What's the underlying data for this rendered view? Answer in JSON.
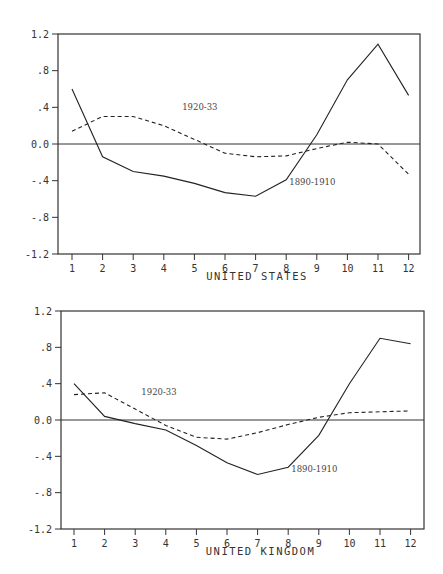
{
  "chart_data": [
    {
      "type": "line",
      "title": "",
      "xlabel": "UNITED STATES",
      "ylabel": "",
      "x": [
        1,
        2,
        3,
        4,
        5,
        6,
        7,
        8,
        9,
        10,
        11,
        12
      ],
      "xticks": [
        "1",
        "2",
        "3",
        "4",
        "5",
        "6",
        "7",
        "8",
        "9",
        "10",
        "11",
        "12"
      ],
      "yticks": [
        "1.2",
        ".8",
        ".4",
        "0.0",
        "-.4",
        "-.8",
        "-1.2"
      ],
      "ytick_values": [
        1.2,
        0.8,
        0.4,
        0.0,
        -0.4,
        -0.8,
        -1.2
      ],
      "ylim": [
        -1.2,
        1.2
      ],
      "grid": false,
      "zero_line": true,
      "series": [
        {
          "name": "1890-1910",
          "style": "solid",
          "values": [
            0.6,
            -0.14,
            -0.3,
            -0.35,
            -0.43,
            -0.53,
            -0.57,
            -0.39,
            0.1,
            0.7,
            1.09,
            0.53
          ]
        },
        {
          "name": "1920-33",
          "style": "dashed",
          "values": [
            0.14,
            0.3,
            0.3,
            0.2,
            0.05,
            -0.1,
            -0.14,
            -0.13,
            -0.05,
            0.02,
            0.0,
            -0.33
          ]
        }
      ],
      "annotations": [
        {
          "text": "1920-33",
          "x": 4.6,
          "y": 0.37
        },
        {
          "text": "1890-1910",
          "x": 8.1,
          "y": -0.45
        }
      ]
    },
    {
      "type": "line",
      "title": "",
      "xlabel": "UNITED KINGDOM",
      "ylabel": "",
      "x": [
        1,
        2,
        3,
        4,
        5,
        6,
        7,
        8,
        9,
        10,
        11,
        12
      ],
      "xticks": [
        "1",
        "2",
        "3",
        "4",
        "5",
        "6",
        "7",
        "8",
        "9",
        "10",
        "11",
        "12"
      ],
      "yticks": [
        "1.2",
        ".8",
        ".4",
        "0.0",
        "-.4",
        "-.8",
        "-1.2"
      ],
      "ytick_values": [
        1.2,
        0.8,
        0.4,
        0.0,
        -0.4,
        -0.8,
        -1.2
      ],
      "ylim": [
        -1.2,
        1.2
      ],
      "grid": false,
      "zero_line": true,
      "series": [
        {
          "name": "1890-1910",
          "style": "solid",
          "values": [
            0.4,
            0.04,
            -0.04,
            -0.11,
            -0.28,
            -0.47,
            -0.6,
            -0.52,
            -0.17,
            0.4,
            0.9,
            0.84
          ]
        },
        {
          "name": "1920-33",
          "style": "dashed",
          "values": [
            0.28,
            0.3,
            0.12,
            -0.06,
            -0.19,
            -0.21,
            -0.14,
            -0.05,
            0.03,
            0.08,
            0.09,
            0.1
          ]
        }
      ],
      "annotations": [
        {
          "text": "1920-33",
          "x": 3.2,
          "y": 0.28
        },
        {
          "text": "1890-1910",
          "x": 8.1,
          "y": -0.57
        }
      ]
    }
  ]
}
